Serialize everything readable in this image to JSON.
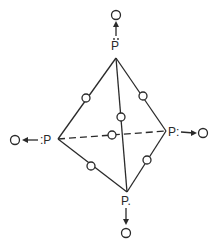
{
  "diagram": {
    "title": "",
    "type": "tetrahedral molecule (P4O)",
    "colors": {
      "line": "#2a2a2a",
      "background": "#ffffff"
    },
    "vertices": [
      {
        "id": "top",
        "label": "P",
        "dots": "two-above",
        "x": 116,
        "y": 58
      },
      {
        "id": "left",
        "label": ":P",
        "x": 58,
        "y": 139
      },
      {
        "id": "right",
        "label": "P:",
        "x": 166,
        "y": 131
      },
      {
        "id": "bottom",
        "label": "P.",
        "dots": "colon-below",
        "x": 127,
        "y": 192
      }
    ],
    "edge_atom_label": "O",
    "terminal_atoms": [
      {
        "attached_to": "top",
        "label": "O",
        "direction": "up"
      },
      {
        "attached_to": "left",
        "label": "O",
        "direction": "left"
      },
      {
        "attached_to": "right",
        "label": "O",
        "direction": "right"
      },
      {
        "attached_to": "bottom",
        "label": "O",
        "direction": "down"
      }
    ],
    "edges": [
      {
        "from": "top",
        "to": "left",
        "style": "solid",
        "bridge": "O"
      },
      {
        "from": "top",
        "to": "right",
        "style": "solid",
        "bridge": "O"
      },
      {
        "from": "top",
        "to": "bottom",
        "style": "solid",
        "bridge": "O"
      },
      {
        "from": "left",
        "to": "right",
        "style": "dashed",
        "bridge": "O"
      },
      {
        "from": "left",
        "to": "bottom",
        "style": "solid",
        "bridge": "O"
      },
      {
        "from": "right",
        "to": "bottom",
        "style": "solid",
        "bridge": "O"
      }
    ],
    "labels": {
      "top_p": "P",
      "left_p": ":P",
      "right_p": "P:",
      "bottom_p": "P."
    }
  }
}
